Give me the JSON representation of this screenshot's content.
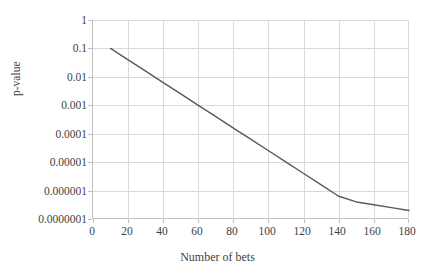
{
  "chart_data": {
    "type": "line",
    "title": "",
    "xlabel": "Number of bets",
    "ylabel": "p-value",
    "yscale": "log",
    "xlim": [
      0,
      180
    ],
    "ylim": [
      1e-07,
      1
    ],
    "grid": true,
    "legend": null,
    "xticks": [
      0,
      20,
      40,
      60,
      80,
      100,
      120,
      140,
      160,
      180
    ],
    "xtick_labels": [
      "0",
      "20",
      "40",
      "60",
      "80",
      "100",
      "120",
      "140",
      "160",
      "180"
    ],
    "yticks": [
      1,
      0.1,
      0.01,
      0.001,
      0.0001,
      1e-05,
      1e-06,
      1e-07
    ],
    "ytick_labels": [
      "1",
      "0.1",
      "0.01",
      "0.001",
      "0.0001",
      "0.00001",
      "0.000001",
      "0.0000001"
    ],
    "series": [
      {
        "name": "p-value",
        "color": "#595959",
        "x": [
          10,
          20,
          30,
          40,
          50,
          60,
          70,
          80,
          90,
          100,
          110,
          120,
          130,
          140,
          150,
          160,
          170,
          180
        ],
        "y": [
          0.1,
          0.0398,
          0.0158,
          0.00631,
          0.00251,
          0.001,
          0.000398,
          0.000158,
          6.31e-05,
          2.51e-05,
          1e-05,
          3.98e-06,
          1.58e-06,
          6.31e-07,
          3.98e-07,
          3.16e-07,
          2.51e-07,
          2e-07
        ]
      }
    ]
  },
  "colors": {
    "line": "#595959",
    "grid": "#d9d9d9",
    "axis": "#bfbfbf",
    "text": "#3f3f3f",
    "background": "#ffffff"
  }
}
